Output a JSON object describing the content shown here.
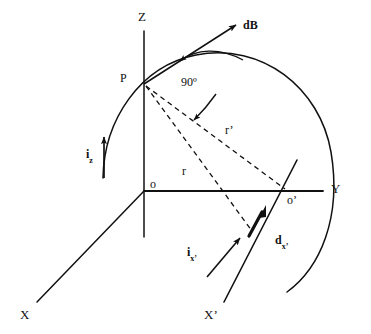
{
  "figure": {
    "background_color": "#ffffff",
    "stroke_color": "#111111",
    "width": 371,
    "height": 334
  },
  "axes": [
    {
      "id": "z",
      "label": "Z",
      "kind": "axis-label"
    },
    {
      "id": "y",
      "label": "Y",
      "kind": "axis-label"
    },
    {
      "id": "x",
      "label": "X",
      "kind": "axis-label"
    },
    {
      "id": "xp",
      "label": "X’",
      "kind": "axis-label"
    }
  ],
  "points": [
    {
      "id": "p",
      "label": "P",
      "kind": "point-label"
    },
    {
      "id": "origin",
      "label": "o",
      "kind": "point-label"
    },
    {
      "id": "origin2",
      "label": "o’",
      "kind": "point-label"
    }
  ],
  "vectors": [
    {
      "id": "db",
      "label": "dB",
      "bold": true,
      "kind": "field-vector"
    },
    {
      "id": "iz",
      "label": "i",
      "subscript": "z",
      "kind": "current-vector"
    },
    {
      "id": "ixp",
      "label": "i",
      "subscript": "x’",
      "kind": "current-vector"
    },
    {
      "id": "dxp",
      "label": "d",
      "subscript": "x’",
      "kind": "element-vector"
    }
  ],
  "distances": [
    {
      "id": "r",
      "label": "r",
      "kind": "dashed-distance"
    },
    {
      "id": "rp",
      "label": "r’",
      "kind": "dashed-distance"
    }
  ],
  "annotations": [
    {
      "id": "right-angle",
      "label": "90º",
      "kind": "angle-annotation"
    }
  ]
}
